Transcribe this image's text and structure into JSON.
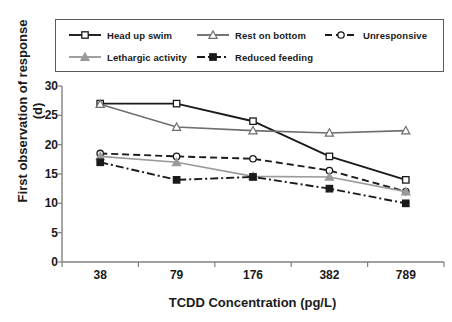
{
  "chart_data": {
    "type": "line",
    "title": "",
    "xlabel": "TCDD Concentration (pg/L)",
    "ylabel": "First observation of response (d)",
    "categories": [
      "38",
      "79",
      "176",
      "382",
      "789"
    ],
    "ylim": [
      0,
      30
    ],
    "ytick_labels": [
      "0",
      "5",
      "10",
      "15",
      "20",
      "25",
      "30"
    ],
    "ytick_values": [
      0,
      5,
      10,
      15,
      20,
      25,
      30
    ],
    "grid": false,
    "legend_position": "top",
    "series": [
      {
        "name": "Head up swim",
        "values": [
          27,
          27,
          24,
          18,
          14
        ],
        "color": "#1a1a1a",
        "line_style": "solid",
        "marker": "open-square"
      },
      {
        "name": "Rest on bottom",
        "values": [
          26.9,
          23,
          22.4,
          22,
          22.4
        ],
        "color": "#6e6e6e",
        "line_style": "solid",
        "marker": "open-triangle"
      },
      {
        "name": "Unresponsive",
        "values": [
          18.5,
          18,
          17.6,
          15.6,
          12
        ],
        "color": "#1a1a1a",
        "line_style": "dashed",
        "marker": "open-circle"
      },
      {
        "name": "Lethargic activity",
        "values": [
          18,
          17,
          14.6,
          14.5,
          12
        ],
        "color": "#9a9a9a",
        "line_style": "solid",
        "marker": "filled-triangle"
      },
      {
        "name": "Reduced feeding",
        "values": [
          17,
          14,
          14.5,
          12.5,
          10
        ],
        "color": "#1a1a1a",
        "line_style": "dash-dot",
        "marker": "filled-square"
      }
    ]
  },
  "legend": {
    "entries": [
      {
        "label": "Head up swim"
      },
      {
        "label": "Rest on bottom"
      },
      {
        "label": "Unresponsive"
      },
      {
        "label": "Lethargic activity"
      },
      {
        "label": "Reduced feeding"
      }
    ]
  },
  "axes": {
    "x_title": "TCDD Concentration (pg/L)",
    "y_title": "First observation of response (d)"
  }
}
